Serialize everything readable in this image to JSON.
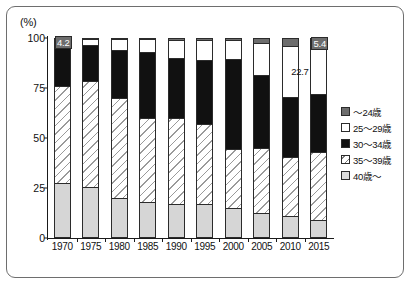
{
  "chart_data": {
    "type": "bar",
    "subtype": "stacked-100-percent",
    "title": "",
    "xlabel": "",
    "ylabel": "(%)",
    "ylim": [
      0,
      100
    ],
    "yticks": [
      0,
      25,
      50,
      75,
      100
    ],
    "grid": false,
    "legend_position": "right",
    "categories": [
      "1970",
      "1975",
      "1980",
      "1985",
      "1990",
      "1995",
      "2000",
      "2005",
      "2010",
      "2015"
    ],
    "series": [
      {
        "name": "40歳～",
        "key": "age40up",
        "color": "#d6d6d6",
        "pattern": "solid-light-gray",
        "values": [
          27.5,
          25.5,
          20.0,
          18.0,
          17.0,
          17.0,
          15.0,
          12.5,
          11.0,
          9.0
        ]
      },
      {
        "name": "35～39歳",
        "key": "age35_39",
        "color": "#ffffff",
        "pattern": "diagonal-hatch",
        "values": [
          48.3,
          53.0,
          50.0,
          42.0,
          43.0,
          40.0,
          29.5,
          32.5,
          29.5,
          34.0
        ]
      },
      {
        "name": "30～34歳",
        "key": "age30_34",
        "color": "#111111",
        "pattern": "solid-black",
        "values": [
          20.0,
          18.0,
          24.0,
          33.0,
          30.0,
          32.0,
          45.0,
          36.5,
          30.0,
          28.9
        ]
      },
      {
        "name": "25～29歳",
        "key": "age25_29",
        "color": "#ffffff",
        "pattern": "solid-white",
        "values": [
          4.2,
          3.0,
          5.5,
          6.5,
          9.0,
          10.0,
          9.5,
          16.0,
          25.5,
          22.7
        ]
      },
      {
        "name": "～24歳",
        "key": "age_u24",
        "color": "#6d6d6d",
        "pattern": "solid-dark-gray",
        "values": [
          0.0,
          0.5,
          0.5,
          0.5,
          1.0,
          1.0,
          1.0,
          2.5,
          4.0,
          5.4
        ]
      }
    ],
    "annotations": [
      {
        "text": "4.2",
        "category": "1970",
        "series": "25～29歳",
        "style": "boxed"
      },
      {
        "text": "5.4",
        "category": "2015",
        "series": "～24歳",
        "style": "boxed"
      },
      {
        "text": "22.7",
        "category": "2015",
        "series": "25～29歳",
        "style": "plain"
      }
    ]
  },
  "axis": {
    "unit_label": "(%)",
    "y_tick_labels": [
      "100",
      "75",
      "50",
      "25",
      "0"
    ],
    "x_tick_labels": [
      "1970",
      "1975",
      "1980",
      "1985",
      "1990",
      "1995",
      "2000",
      "2005",
      "2010",
      "2015"
    ]
  },
  "legend": {
    "items": [
      {
        "label": "～24歳",
        "swatch": "dark-gray-swatch"
      },
      {
        "label": "25～29歳",
        "swatch": "white-swatch"
      },
      {
        "label": "30～34歳",
        "swatch": "black-swatch"
      },
      {
        "label": "35～39歳",
        "swatch": "hatched-swatch"
      },
      {
        "label": "40歳～",
        "swatch": "light-gray-swatch"
      }
    ]
  }
}
